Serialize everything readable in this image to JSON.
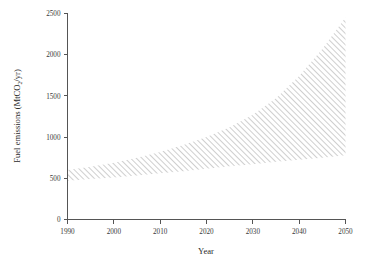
{
  "figure": {
    "background": "#ffffff",
    "axis_color": "#555555",
    "hatch_color": "#8d8d8d"
  },
  "axes": {
    "x_title": "Year",
    "y_title_main": "Fuel emissions (MtCO",
    "y_title_sub": "2",
    "y_title_tail": "/yr)",
    "y_title_full": "Fuel emissions (MtCO2/yr)",
    "x_ticks": [
      "1990",
      "2000",
      "2010",
      "2020",
      "2030",
      "2040",
      "2050"
    ],
    "y_ticks": [
      "0",
      "500",
      "1000",
      "1500",
      "2000",
      "2500"
    ]
  },
  "chart_data": {
    "type": "area",
    "title": "",
    "xlabel": "Year",
    "ylabel": "Fuel emissions (MtCO2/yr)",
    "xlim": [
      1990,
      2050
    ],
    "ylim": [
      0,
      2500
    ],
    "grid": false,
    "legend": "none",
    "style": "diagonal hatched uncertainty band, no fill, 45 degree lines",
    "x": [
      1990,
      1995,
      2000,
      2005,
      2010,
      2015,
      2020,
      2025,
      2030,
      2035,
      2040,
      2045,
      2050
    ],
    "series": [
      {
        "name": "upper bound",
        "values": [
          600,
          640,
          690,
          750,
          820,
          905,
          1000,
          1120,
          1270,
          1470,
          1740,
          2070,
          2450
        ]
      },
      {
        "name": "lower bound",
        "values": [
          470,
          490,
          510,
          535,
          560,
          585,
          615,
          645,
          670,
          700,
          725,
          750,
          780
        ]
      }
    ],
    "annotations": []
  }
}
